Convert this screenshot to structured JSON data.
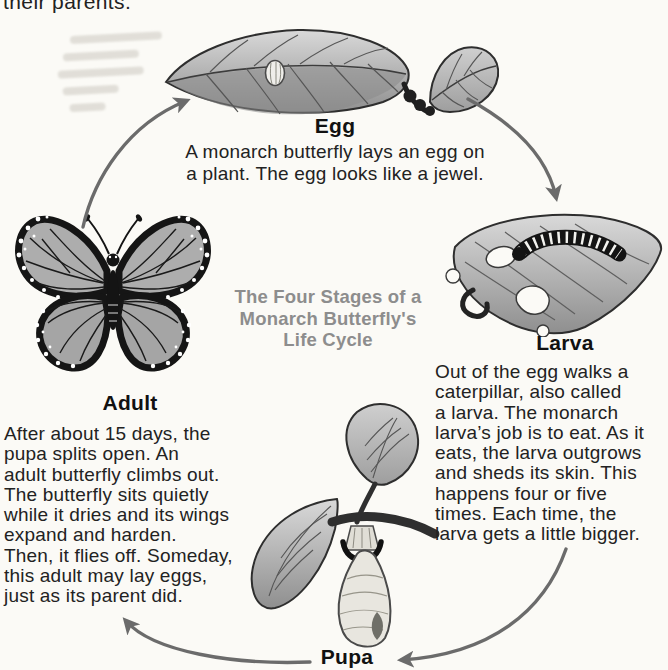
{
  "page": {
    "previous_page_fragment": "their parents.",
    "cycle_title": "The Four Stages of a\nMonarch Butterfly's\nLife Cycle"
  },
  "colors": {
    "paper": "#fbfaf6",
    "ink": "#1c1c1c",
    "title_gray": "#8d8d8d",
    "arrow_gray": "#6b6b6b"
  },
  "stages": {
    "egg": {
      "label": "Egg",
      "caption": "A monarch butterfly lays an egg on\na plant. The egg looks like a jewel."
    },
    "larva": {
      "label": "Larva",
      "caption": "Out of the egg walks a\ncaterpillar, also called\na larva. The monarch\nlarva’s job is to eat. As it\neats, the larva outgrows\nand sheds its skin. This\nhappens four or five\ntimes. Each time, the\nlarva gets a little bigger."
    },
    "pupa": {
      "label": "Pupa"
    },
    "adult": {
      "label": "Adult",
      "caption": "After about 15 days, the\npupa splits open. An\nadult butterfly climbs out.\nThe butterfly sits quietly\nwhile it dries and its wings\nexpand and harden.\nThen, it flies off. Someday,\nthis adult may lay eggs,\njust as its parent did."
    }
  }
}
